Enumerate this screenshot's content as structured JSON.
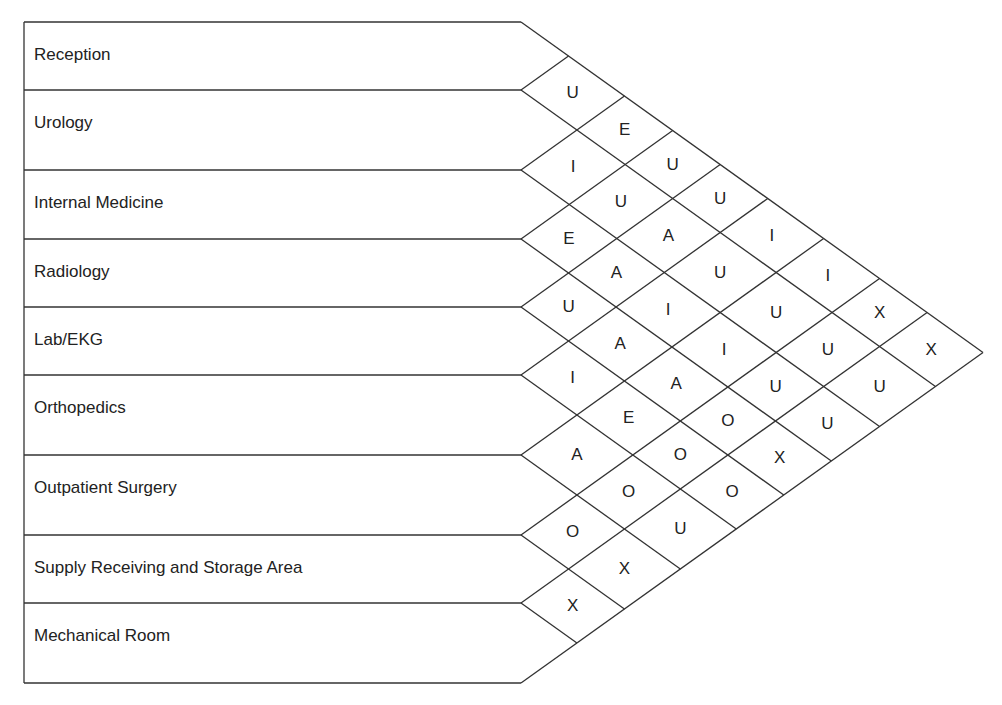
{
  "departments": [
    {
      "id": "reception",
      "label": "Reception"
    },
    {
      "id": "urology",
      "label": "Urology"
    },
    {
      "id": "internal-medicine",
      "label": "Internal Medicine"
    },
    {
      "id": "radiology",
      "label": "Radiology"
    },
    {
      "id": "lab-ekg",
      "label": "Lab/EKG"
    },
    {
      "id": "orthopedics",
      "label": "Orthopedics"
    },
    {
      "id": "outpatient-surgery",
      "label": "Outpatient Surgery"
    },
    {
      "id": "supply-receiving",
      "label": "Supply Receiving and Storage Area"
    },
    {
      "id": "mechanical-room",
      "label": "Mechanical Room"
    }
  ],
  "layout": {
    "row_boundaries": [
      22,
      90,
      170,
      239,
      307,
      375,
      455,
      535,
      603,
      683
    ],
    "table_left": 24,
    "table_right": 521,
    "apex_x": 983,
    "line_color": "#333333"
  },
  "relationships": [
    {
      "a": 0,
      "b": 1,
      "code": "U"
    },
    {
      "a": 1,
      "b": 2,
      "code": "I"
    },
    {
      "a": 2,
      "b": 3,
      "code": "E"
    },
    {
      "a": 3,
      "b": 4,
      "code": "U"
    },
    {
      "a": 4,
      "b": 5,
      "code": "I"
    },
    {
      "a": 5,
      "b": 6,
      "code": "A"
    },
    {
      "a": 6,
      "b": 7,
      "code": "O"
    },
    {
      "a": 7,
      "b": 8,
      "code": "X"
    },
    {
      "a": 0,
      "b": 2,
      "code": "E"
    },
    {
      "a": 1,
      "b": 3,
      "code": "U"
    },
    {
      "a": 2,
      "b": 4,
      "code": "A"
    },
    {
      "a": 3,
      "b": 5,
      "code": "A"
    },
    {
      "a": 4,
      "b": 6,
      "code": "E"
    },
    {
      "a": 5,
      "b": 7,
      "code": "O"
    },
    {
      "a": 6,
      "b": 8,
      "code": "X"
    },
    {
      "a": 0,
      "b": 3,
      "code": "U"
    },
    {
      "a": 1,
      "b": 4,
      "code": "A"
    },
    {
      "a": 2,
      "b": 5,
      "code": "I"
    },
    {
      "a": 3,
      "b": 6,
      "code": "A"
    },
    {
      "a": 4,
      "b": 7,
      "code": "O"
    },
    {
      "a": 5,
      "b": 8,
      "code": "U"
    },
    {
      "a": 0,
      "b": 4,
      "code": "U"
    },
    {
      "a": 1,
      "b": 5,
      "code": "U"
    },
    {
      "a": 2,
      "b": 6,
      "code": "I"
    },
    {
      "a": 3,
      "b": 7,
      "code": "O"
    },
    {
      "a": 4,
      "b": 8,
      "code": "O"
    },
    {
      "a": 0,
      "b": 5,
      "code": "I"
    },
    {
      "a": 1,
      "b": 6,
      "code": "U"
    },
    {
      "a": 2,
      "b": 7,
      "code": "U"
    },
    {
      "a": 3,
      "b": 8,
      "code": "X"
    },
    {
      "a": 0,
      "b": 6,
      "code": "I"
    },
    {
      "a": 1,
      "b": 7,
      "code": "U"
    },
    {
      "a": 2,
      "b": 8,
      "code": "U"
    },
    {
      "a": 0,
      "b": 7,
      "code": "X"
    },
    {
      "a": 1,
      "b": 8,
      "code": "U"
    },
    {
      "a": 0,
      "b": 8,
      "code": "X"
    }
  ]
}
